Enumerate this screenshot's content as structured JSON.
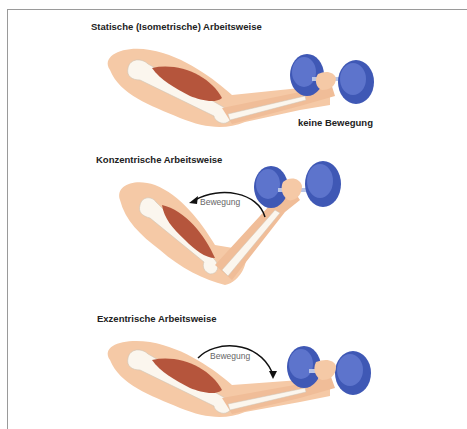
{
  "panels": [
    {
      "id": "static",
      "title": "Statische (Isometrische) Arbeitsweise",
      "movement_label": "keine Bewegung",
      "arrow": "none"
    },
    {
      "id": "concentric",
      "title": "Konzentrische Arbeitsweise",
      "movement_label": "Bewegung",
      "arrow": "counterclockwise-up"
    },
    {
      "id": "eccentric",
      "title": "Exzentrische Arbeitsweise",
      "movement_label": "Bewegung",
      "arrow": "clockwise-down"
    }
  ],
  "colors": {
    "skin": "#f5c9a6",
    "skin_shadow": "#efb58e",
    "bone": "#fbf6ee",
    "muscle": "#b5553c",
    "dumbbell": "#3f58b5",
    "dumbbell_light": "#5d74cc",
    "frame": "#9a9a9a"
  }
}
